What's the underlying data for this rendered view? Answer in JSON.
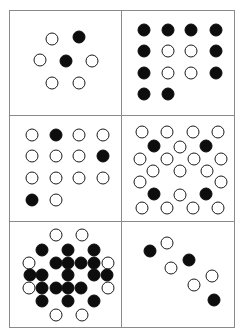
{
  "figure": {
    "title": "",
    "colors": {
      "filled": "#0d0d0d",
      "open_stroke": "#1a1a1a",
      "open_fill": "#ffffff",
      "frame": "#8a8a8a",
      "background": "#ffffff"
    },
    "layout": {
      "columns": 2,
      "rows": 3,
      "panel_count": 6
    },
    "dot_diameter_px": 13,
    "panels": [
      {
        "id": "panel-1",
        "name": "hexagon-7-dots",
        "position": "top-left",
        "dot_count": 7,
        "filled_count": 2,
        "open_count": 5,
        "dots": [
          {
            "x": 38,
            "y": 27,
            "state": "open"
          },
          {
            "x": 62,
            "y": 25,
            "state": "filled"
          },
          {
            "x": 27,
            "y": 47,
            "state": "open"
          },
          {
            "x": 50,
            "y": 48,
            "state": "filled"
          },
          {
            "x": 74,
            "y": 48,
            "state": "open"
          },
          {
            "x": 38,
            "y": 69,
            "state": "open"
          },
          {
            "x": 62,
            "y": 69,
            "state": "open"
          }
        ]
      },
      {
        "id": "panel-2",
        "name": "square-ring-14-dots",
        "position": "top-right",
        "dot_count": 14,
        "filled_count": 10,
        "open_count": 4,
        "dots": [
          {
            "x": 20,
            "y": 18,
            "state": "filled"
          },
          {
            "x": 41,
            "y": 18,
            "state": "filled"
          },
          {
            "x": 62,
            "y": 18,
            "state": "filled"
          },
          {
            "x": 84,
            "y": 18,
            "state": "filled"
          },
          {
            "x": 20,
            "y": 38,
            "state": "filled"
          },
          {
            "x": 41,
            "y": 38,
            "state": "open"
          },
          {
            "x": 62,
            "y": 38,
            "state": "open"
          },
          {
            "x": 84,
            "y": 38,
            "state": "filled"
          },
          {
            "x": 20,
            "y": 59,
            "state": "filled"
          },
          {
            "x": 41,
            "y": 59,
            "state": "open"
          },
          {
            "x": 62,
            "y": 59,
            "state": "open"
          },
          {
            "x": 84,
            "y": 59,
            "state": "filled"
          },
          {
            "x": 20,
            "y": 80,
            "state": "filled"
          },
          {
            "x": 41,
            "y": 80,
            "state": "filled"
          }
        ]
      },
      {
        "id": "panel-3",
        "name": "grid-14-dots-sparse-filled",
        "position": "middle-left",
        "dot_count": 14,
        "filled_count": 3,
        "open_count": 11,
        "dots": [
          {
            "x": 20,
            "y": 18,
            "state": "open"
          },
          {
            "x": 41,
            "y": 18,
            "state": "filled"
          },
          {
            "x": 62,
            "y": 18,
            "state": "open"
          },
          {
            "x": 84,
            "y": 18,
            "state": "open"
          },
          {
            "x": 20,
            "y": 38,
            "state": "open"
          },
          {
            "x": 41,
            "y": 38,
            "state": "open"
          },
          {
            "x": 62,
            "y": 38,
            "state": "open"
          },
          {
            "x": 84,
            "y": 38,
            "state": "filled"
          },
          {
            "x": 20,
            "y": 59,
            "state": "open"
          },
          {
            "x": 41,
            "y": 59,
            "state": "open"
          },
          {
            "x": 62,
            "y": 59,
            "state": "open"
          },
          {
            "x": 84,
            "y": 59,
            "state": "open"
          },
          {
            "x": 20,
            "y": 80,
            "state": "filled"
          },
          {
            "x": 41,
            "y": 80,
            "state": "open"
          }
        ]
      },
      {
        "id": "panel-4",
        "name": "hex-lattice-23-dots",
        "position": "middle-right",
        "dot_count": 23,
        "filled_count": 4,
        "open_count": 19,
        "dots": [
          {
            "x": 18,
            "y": 15,
            "state": "open"
          },
          {
            "x": 40,
            "y": 15,
            "state": "open"
          },
          {
            "x": 63,
            "y": 15,
            "state": "open"
          },
          {
            "x": 86,
            "y": 15,
            "state": "open"
          },
          {
            "x": 29,
            "y": 28,
            "state": "filled"
          },
          {
            "x": 52,
            "y": 29,
            "state": "open"
          },
          {
            "x": 75,
            "y": 28,
            "state": "filled"
          },
          {
            "x": 16,
            "y": 41,
            "state": "open"
          },
          {
            "x": 88,
            "y": 41,
            "state": "open"
          },
          {
            "x": 28,
            "y": 52,
            "state": "open"
          },
          {
            "x": 52,
            "y": 52,
            "state": "open"
          },
          {
            "x": 76,
            "y": 52,
            "state": "open"
          },
          {
            "x": 16,
            "y": 63,
            "state": "open"
          },
          {
            "x": 88,
            "y": 63,
            "state": "open"
          },
          {
            "x": 29,
            "y": 74,
            "state": "filled"
          },
          {
            "x": 52,
            "y": 75,
            "state": "open"
          },
          {
            "x": 75,
            "y": 74,
            "state": "filled"
          },
          {
            "x": 18,
            "y": 88,
            "state": "open"
          },
          {
            "x": 40,
            "y": 88,
            "state": "open"
          },
          {
            "x": 63,
            "y": 88,
            "state": "open"
          },
          {
            "x": 86,
            "y": 88,
            "state": "open"
          },
          {
            "x": 40,
            "y": 41,
            "state": "open"
          },
          {
            "x": 64,
            "y": 41,
            "state": "open"
          }
        ]
      },
      {
        "id": "panel-5",
        "name": "dense-hex-cluster-filled-core",
        "position": "bottom-left",
        "dot_count": 27,
        "filled_count": 19,
        "open_count": 8,
        "dots": [
          {
            "x": 41,
            "y": 13,
            "state": "open"
          },
          {
            "x": 65,
            "y": 13,
            "state": "open"
          },
          {
            "x": 29,
            "y": 27,
            "state": "filled"
          },
          {
            "x": 52,
            "y": 27,
            "state": "filled"
          },
          {
            "x": 76,
            "y": 27,
            "state": "filled"
          },
          {
            "x": 17,
            "y": 39,
            "state": "open"
          },
          {
            "x": 41,
            "y": 39,
            "state": "filled"
          },
          {
            "x": 64,
            "y": 39,
            "state": "filled"
          },
          {
            "x": 88,
            "y": 39,
            "state": "open"
          },
          {
            "x": 29,
            "y": 51,
            "state": "filled"
          },
          {
            "x": 52,
            "y": 51,
            "state": "filled"
          },
          {
            "x": 76,
            "y": 51,
            "state": "filled"
          },
          {
            "x": 17,
            "y": 63,
            "state": "open"
          },
          {
            "x": 41,
            "y": 63,
            "state": "filled"
          },
          {
            "x": 64,
            "y": 63,
            "state": "filled"
          },
          {
            "x": 88,
            "y": 63,
            "state": "open"
          },
          {
            "x": 29,
            "y": 75,
            "state": "filled"
          },
          {
            "x": 52,
            "y": 75,
            "state": "filled"
          },
          {
            "x": 76,
            "y": 75,
            "state": "filled"
          },
          {
            "x": 41,
            "y": 89,
            "state": "open"
          },
          {
            "x": 65,
            "y": 89,
            "state": "open"
          },
          {
            "x": 18,
            "y": 51,
            "state": "filled"
          },
          {
            "x": 87,
            "y": 51,
            "state": "filled"
          },
          {
            "x": 52,
            "y": 39,
            "state": "filled"
          },
          {
            "x": 52,
            "y": 63,
            "state": "filled"
          },
          {
            "x": 29,
            "y": 63,
            "state": "filled"
          },
          {
            "x": 76,
            "y": 39,
            "state": "filled"
          }
        ]
      },
      {
        "id": "panel-6",
        "name": "diagonal-zigzag-chain-7-dots",
        "position": "bottom-right",
        "dot_count": 7,
        "filled_count": 3,
        "open_count": 4,
        "dots": [
          {
            "x": 25,
            "y": 28,
            "state": "filled"
          },
          {
            "x": 40,
            "y": 20,
            "state": "open"
          },
          {
            "x": 44,
            "y": 44,
            "state": "open"
          },
          {
            "x": 60,
            "y": 36,
            "state": "filled"
          },
          {
            "x": 64,
            "y": 60,
            "state": "open"
          },
          {
            "x": 80,
            "y": 52,
            "state": "open"
          },
          {
            "x": 82,
            "y": 74,
            "state": "filled"
          }
        ]
      }
    ]
  }
}
